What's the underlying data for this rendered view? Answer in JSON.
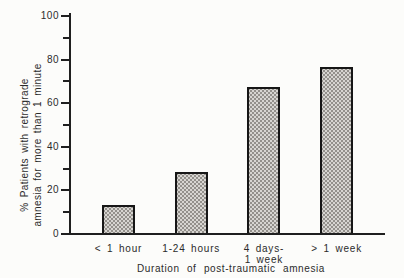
{
  "chart_data": {
    "type": "bar",
    "title": "",
    "categories": [
      "< 1 hour",
      "1-24 hours",
      "4 days-\n1 week",
      "> 1 week"
    ],
    "values": [
      13,
      28,
      67,
      76
    ],
    "xlabel": "Duration of post-traumatic amnesia",
    "ylabel_line1": "% Patients with retrograde",
    "ylabel_line2": "amnesia for more than 1 minute",
    "ylim": [
      0,
      100
    ],
    "ytick_major": [
      0,
      20,
      40,
      60,
      80,
      100
    ],
    "ytick_minor": [
      10,
      30,
      50,
      70,
      90
    ],
    "grid": false,
    "legend": false,
    "colors": {
      "background": "#fcfcfa",
      "axis": "#1f1f1f",
      "bar_fill": "#d7d5d1",
      "bar_dots": "#93908b",
      "bar_border": "#161616",
      "text": "#2b2b2b"
    }
  }
}
